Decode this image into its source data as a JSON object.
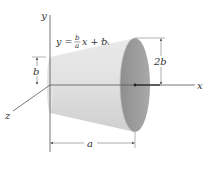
{
  "figure": {
    "type": "frustum-of-cone",
    "equation": {
      "lhs": "y =",
      "frac_num": "b",
      "frac_den": "a",
      "rhs": "x + b"
    },
    "axes": {
      "x_label": "x",
      "y_label": "y",
      "z_label": "z"
    },
    "dimensions": {
      "left_radius": "b",
      "right_radius": "2b",
      "length": "a"
    },
    "colors": {
      "body_light": "#e4e4e4",
      "body_mid": "#d2d2d2",
      "end_face": "#9c9c9c",
      "axis": "#555555",
      "text": "#333333"
    }
  }
}
